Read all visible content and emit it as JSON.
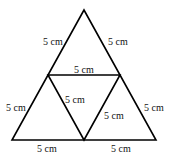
{
  "diagram": {
    "stroke_color": "#000000",
    "vertices": {
      "apex": [
        84,
        10
      ],
      "mid_left": [
        48,
        75
      ],
      "mid_right": [
        120,
        75
      ],
      "bottom_left": [
        12,
        140
      ],
      "bottom_mid": [
        84,
        140
      ],
      "bottom_right": [
        156,
        140
      ]
    },
    "labels": {
      "top_left_side": "5 cm",
      "top_right_side": "5 cm",
      "middle_horizontal": "5 cm",
      "lower_left_side": "5 cm",
      "inner_left_diagonal": "5 cm",
      "inner_right_diagonal": "5 cm",
      "lower_right_side": "5 cm",
      "bottom_left_base": "5 cm",
      "bottom_right_base": "5 cm"
    }
  }
}
